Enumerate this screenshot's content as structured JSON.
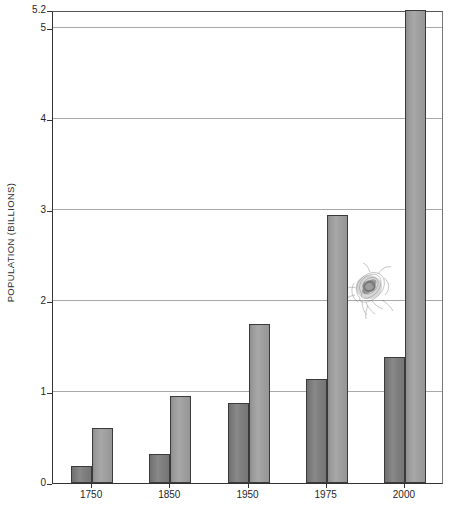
{
  "chart_data": {
    "type": "bar",
    "title": "",
    "subtitle": "",
    "xlabel": "",
    "ylabel": "POPULATION (BILLIONS)",
    "categories": [
      "1750",
      "1850",
      "1950",
      "1975",
      "2000"
    ],
    "series": [
      {
        "name": "series-dark",
        "color": "#7c7c7c",
        "values": [
          0.19,
          0.32,
          0.88,
          1.14,
          1.39
        ]
      },
      {
        "name": "series-light",
        "color": "#9e9e9e",
        "values": [
          0.6,
          0.96,
          1.75,
          2.95,
          5.2
        ]
      }
    ],
    "ylim": [
      0,
      5.2
    ],
    "ytick_labels": [
      "0",
      "1",
      "2",
      "3",
      "4",
      "5",
      "5.2"
    ],
    "ytick_values": [
      0,
      1,
      2,
      3,
      4,
      5,
      5.2
    ],
    "gridline_values": [
      1,
      2,
      3,
      4,
      5
    ],
    "grid": true,
    "legend": "none",
    "annotations": [
      {
        "name": "pencil-scribble-smudge",
        "kind": "hand-drawn-mark",
        "x_px": 368,
        "y_px": 287
      }
    ],
    "axis_colors": {
      "frame": "#333333",
      "grid": "#a8a8a8",
      "text": "#1f1f1f"
    }
  }
}
